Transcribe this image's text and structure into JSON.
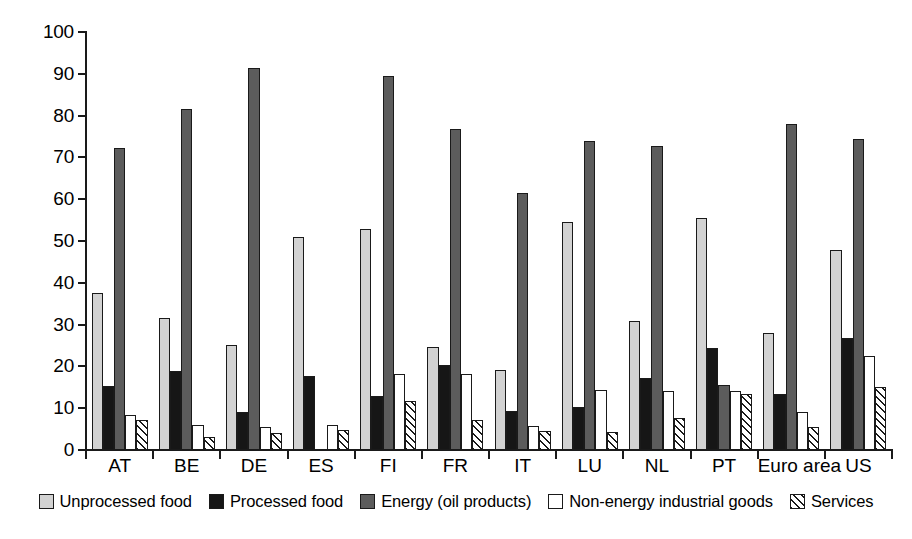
{
  "chart_data": {
    "type": "bar",
    "title": "",
    "subtitle": "",
    "xlabel": "",
    "ylabel": "",
    "ylim": [
      0,
      100
    ],
    "yticks": [
      0,
      10,
      20,
      30,
      40,
      50,
      60,
      70,
      80,
      90,
      100
    ],
    "grid": false,
    "legend_position": "bottom",
    "categories": [
      "AT",
      "BE",
      "DE",
      "ES",
      "FI",
      "FR",
      "IT",
      "LU",
      "NL",
      "PT",
      "Euro area",
      "US"
    ],
    "series": [
      {
        "name": "Unprocessed food",
        "color": "#d2d2d2",
        "values": [
          37.5,
          31.5,
          25.2,
          51.0,
          52.8,
          24.7,
          19.2,
          54.5,
          30.8,
          55.4,
          28.0,
          47.8
        ]
      },
      {
        "name": "Processed food",
        "color": "#161616",
        "values": [
          15.3,
          19.0,
          9.0,
          17.6,
          13.0,
          20.4,
          9.4,
          10.4,
          17.2,
          24.4,
          13.4,
          26.8
        ]
      },
      {
        "name": "Energy (oil products)",
        "color": "#5c5c5c",
        "values": [
          72.3,
          81.7,
          91.4,
          0,
          89.4,
          76.9,
          61.6,
          73.9,
          72.7,
          15.6,
          78.0,
          74.3
        ]
      },
      {
        "name": "Non-energy industrial goods",
        "color": "#ffffff",
        "values": [
          8.3,
          6.1,
          5.5,
          6.1,
          18.2,
          18.2,
          5.8,
          14.4,
          14.0,
          14.1,
          9.0,
          22.4
        ]
      },
      {
        "name": "Services",
        "color": "#ffffff",
        "values": [
          7.2,
          3.1,
          4.1,
          4.9,
          11.7,
          7.3,
          4.5,
          4.4,
          7.6,
          13.4,
          5.5,
          15.0
        ]
      }
    ]
  },
  "legend": {
    "items": [
      {
        "label": "Unprocessed food"
      },
      {
        "label": "Processed food"
      },
      {
        "label": "Energy (oil products)"
      },
      {
        "label": "Non-energy industrial goods"
      },
      {
        "label": "Services"
      }
    ]
  }
}
